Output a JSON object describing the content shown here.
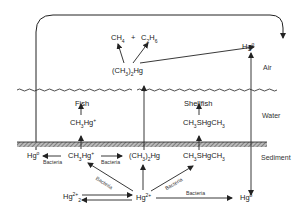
{
  "zones": {
    "air": "Air",
    "water": "Water",
    "sediment": "Sediment"
  },
  "species": {
    "ch4": "CH4",
    "plus": "+",
    "c2h6": "C2H6",
    "dimethyl_hg_air": "(CH3)2Hg",
    "hg0_air": "Hg0",
    "fish": "Fish",
    "shellfish": "Shellfish",
    "methyl_hg_water": "CH3Hg+",
    "ch3shgch3_water": "CH3SHgCH3",
    "hg0_sediment_left": "Hg0",
    "methyl_hg_sediment": "CH3Hg+",
    "dimethyl_hg_sediment": "(CH3)2Hg",
    "ch3shgch3_sediment": "CH3SHgCH3",
    "hg2_2plus": "Hg2 2+",
    "hg2plus": "Hg2+",
    "hg0_sediment_right": "Hg0"
  },
  "process_labels": {
    "bacteria_demethylation": "Bacteria",
    "bacteria_methylation": "Bacteria",
    "bacteria_hg2_to_ch3hg": "Bacteria",
    "bacteria_hg2_to_ch3shgch3": "Bacteria",
    "bacteria_hg2_to_hg0": "Bacteria"
  },
  "colors": {
    "line": "#222222",
    "background": "#ffffff",
    "hatch": "#777777"
  }
}
